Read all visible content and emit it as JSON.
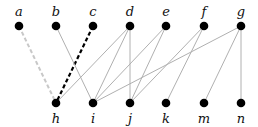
{
  "diagram": {
    "type": "bipartite-graph",
    "top_nodes": [
      {
        "id": "a",
        "label": "a",
        "x": 19,
        "y": 26
      },
      {
        "id": "b",
        "label": "b",
        "x": 56,
        "y": 26
      },
      {
        "id": "c",
        "label": "c",
        "x": 93,
        "y": 26
      },
      {
        "id": "d",
        "label": "d",
        "x": 130,
        "y": 26
      },
      {
        "id": "e",
        "label": "e",
        "x": 166,
        "y": 26
      },
      {
        "id": "f",
        "label": "f",
        "x": 204,
        "y": 26
      },
      {
        "id": "g",
        "label": "g",
        "x": 241,
        "y": 26
      }
    ],
    "bottom_nodes": [
      {
        "id": "h",
        "label": "h",
        "x": 56,
        "y": 103
      },
      {
        "id": "i",
        "label": "i",
        "x": 93,
        "y": 103
      },
      {
        "id": "j",
        "label": "j",
        "x": 130,
        "y": 103
      },
      {
        "id": "k",
        "label": "k",
        "x": 166,
        "y": 103
      },
      {
        "id": "m",
        "label": "m",
        "x": 204,
        "y": 103
      },
      {
        "id": "n",
        "label": "n",
        "x": 241,
        "y": 103
      }
    ],
    "edges": [
      {
        "from": "a",
        "to": "h",
        "style": "dashed-light"
      },
      {
        "from": "c",
        "to": "h",
        "style": "dashed-bold"
      },
      {
        "from": "b",
        "to": "i",
        "style": "solid"
      },
      {
        "from": "d",
        "to": "h",
        "style": "solid"
      },
      {
        "from": "d",
        "to": "i",
        "style": "solid"
      },
      {
        "from": "d",
        "to": "j",
        "style": "solid"
      },
      {
        "from": "e",
        "to": "i",
        "style": "solid"
      },
      {
        "from": "e",
        "to": "j",
        "style": "solid"
      },
      {
        "from": "f",
        "to": "j",
        "style": "solid"
      },
      {
        "from": "f",
        "to": "k",
        "style": "solid"
      },
      {
        "from": "g",
        "to": "i",
        "style": "solid"
      },
      {
        "from": "g",
        "to": "m",
        "style": "solid"
      },
      {
        "from": "g",
        "to": "n",
        "style": "solid"
      }
    ],
    "colors": {
      "node": "#000000",
      "edge": "#b0b0b0",
      "edge_dashed_light": "#c8c8c8",
      "edge_dashed_bold": "#000000"
    }
  }
}
